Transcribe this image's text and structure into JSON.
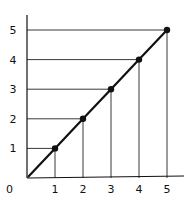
{
  "chart_data": {
    "type": "line",
    "title": "",
    "xlabel": "",
    "ylabel": "",
    "x": [
      1,
      2,
      3,
      4,
      5
    ],
    "series": [
      {
        "name": "y = x",
        "values": [
          1,
          2,
          3,
          4,
          5
        ]
      }
    ],
    "origin_label": "0",
    "x_ticks": [
      "1",
      "2",
      "3",
      "4",
      "5"
    ],
    "y_ticks": [
      "1",
      "2",
      "3",
      "4",
      "5"
    ],
    "xlim": [
      0,
      5.5
    ],
    "ylim": [
      0,
      5.5
    ],
    "grid": false,
    "drop_lines": true,
    "line_from_origin": true,
    "colors": {
      "line": "#111111",
      "axis": "#111111",
      "guide": "#222222",
      "background": "#ffffff"
    }
  }
}
